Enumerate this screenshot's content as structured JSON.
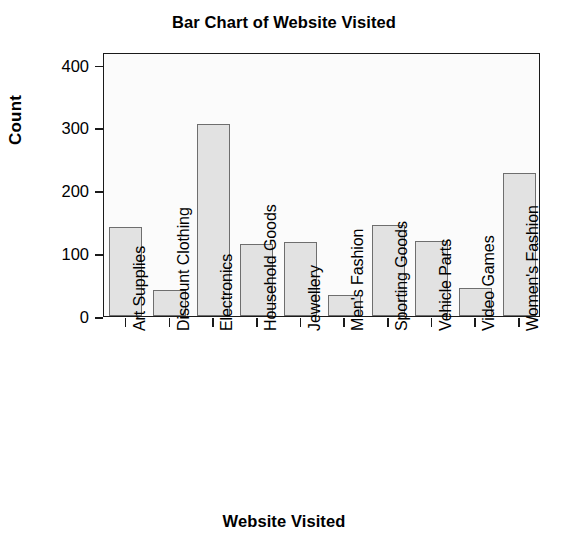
{
  "chart_data": {
    "type": "bar",
    "title": "Bar Chart of Website Visited",
    "xlabel": "Website Visited",
    "ylabel": "Count",
    "categories": [
      "Art Supplies",
      "Discount Clothing",
      "Electronics",
      "Household Goods",
      "Jewellery",
      "Men's Fashion",
      "Sporting Goods",
      "Vehicle Parts",
      "Video Games",
      "Women's Fashion"
    ],
    "values": [
      142,
      42,
      305,
      114,
      118,
      33,
      145,
      119,
      45,
      227
    ],
    "ylim": [
      0,
      420
    ],
    "yticks": [
      0,
      100,
      200,
      300,
      400
    ],
    "ytick_labels": [
      "0",
      "100",
      "200",
      "300",
      "400"
    ],
    "grid": false,
    "legend": false,
    "legend_position": "none",
    "bar_fill_color": "#e2e2e2",
    "bar_edge_color": "#6e6e6e",
    "axis_color": "#1a1a1a",
    "background_color": "#ffffff"
  }
}
